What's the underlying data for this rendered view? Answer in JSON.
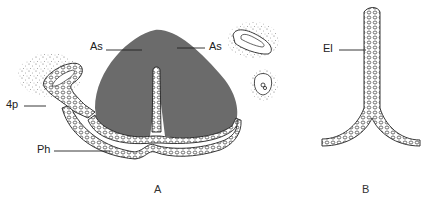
{
  "figure": {
    "panels": [
      {
        "id": "A",
        "label": "A"
      },
      {
        "id": "B",
        "label": "B"
      }
    ],
    "labels": {
      "as_left": "As",
      "as_right": "As",
      "fourth_pouch": "4p",
      "pharynx": "Ph",
      "epithelium": "El"
    },
    "colors": {
      "mass_fill": "#6b6b6b",
      "line": "#222222",
      "stipple": "#555555",
      "background": "#ffffff"
    }
  }
}
